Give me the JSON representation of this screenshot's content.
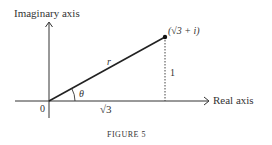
{
  "figure": {
    "caption": "FIGURE 5",
    "y_axis_label": "Imaginary axis",
    "x_axis_label": "Real axis",
    "origin_label": "0",
    "point_label": "(√3 + i)",
    "radius_label": "r",
    "angle_label": "θ",
    "base_label": "√3",
    "height_label": "1"
  }
}
